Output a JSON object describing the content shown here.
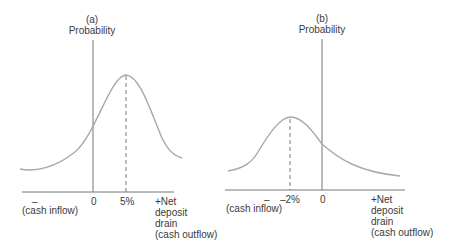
{
  "panels": [
    {
      "id": "a",
      "panel_label": "(a)",
      "y_axis_label": "Probability",
      "minus_label": "–",
      "inflow_label": "(cash inflow)",
      "zero_label": "0",
      "mean_label": "5%",
      "x_axis_label_lines": [
        "+Net",
        "deposit",
        "drain",
        "(cash outflow)"
      ]
    },
    {
      "id": "b",
      "panel_label": "(b)",
      "y_axis_label": "Probability",
      "minus_label": "–",
      "inflow_label": "(cash inflow)",
      "zero_label": "0",
      "mean_label": "–2%",
      "x_axis_label_lines": [
        "+Net",
        "deposit",
        "drain",
        "(cash outflow)"
      ]
    }
  ],
  "colors": {
    "curve": "#a8a8a8",
    "axis": "#777777",
    "text": "#3a3a3a"
  }
}
